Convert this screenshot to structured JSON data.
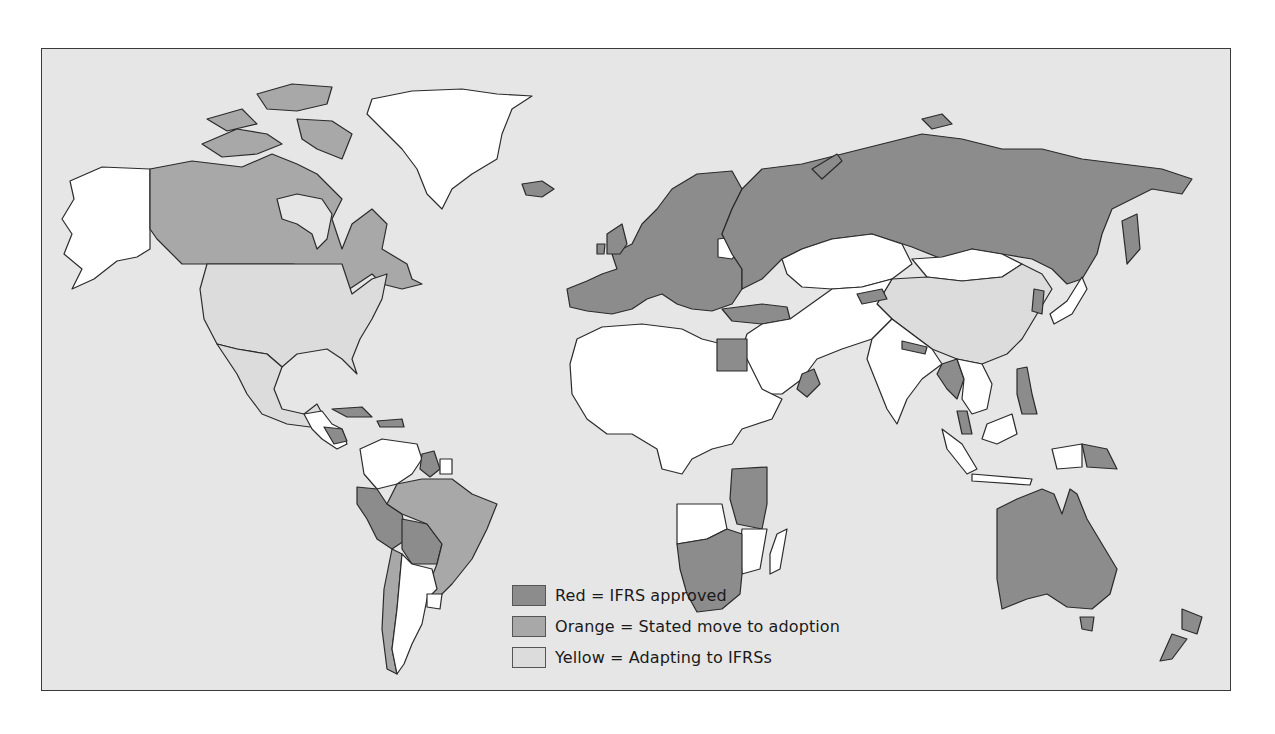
{
  "colors": {
    "ocean": "#e6e6e6",
    "red": "#8c8c8c",
    "orange": "#a8a8a8",
    "yellow": "#dcdcdc",
    "none": "#ffffff",
    "border": "#2b2b2b"
  },
  "legend": {
    "items": [
      {
        "key": "red",
        "label": "Red = IFRS approved"
      },
      {
        "key": "orange",
        "label": "Orange = Stated move to adoption"
      },
      {
        "key": "yellow",
        "label": "Yellow = Adapting to IFRSs"
      }
    ]
  },
  "map": {
    "title": "World map of IFRS adoption status",
    "regions": [
      {
        "name": "Alaska (USA)",
        "status": "none"
      },
      {
        "name": "Canada",
        "status": "orange"
      },
      {
        "name": "Canadian Arctic Islands",
        "status": "orange"
      },
      {
        "name": "Greenland",
        "status": "none"
      },
      {
        "name": "Iceland",
        "status": "red"
      },
      {
        "name": "United States",
        "status": "yellow"
      },
      {
        "name": "Mexico",
        "status": "yellow"
      },
      {
        "name": "Central America",
        "status": "none"
      },
      {
        "name": "Nicaragua",
        "status": "red"
      },
      {
        "name": "Caribbean islands",
        "status": "red"
      },
      {
        "name": "Venezuela / Colombia",
        "status": "none"
      },
      {
        "name": "Guyana",
        "status": "red"
      },
      {
        "name": "Suriname",
        "status": "none"
      },
      {
        "name": "Ecuador",
        "status": "red"
      },
      {
        "name": "Peru",
        "status": "red"
      },
      {
        "name": "Bolivia",
        "status": "red"
      },
      {
        "name": "Brazil",
        "status": "orange"
      },
      {
        "name": "Chile",
        "status": "orange"
      },
      {
        "name": "Argentina",
        "status": "none"
      },
      {
        "name": "Paraguay",
        "status": "none"
      },
      {
        "name": "Uruguay",
        "status": "none"
      },
      {
        "name": "Europe",
        "status": "red"
      },
      {
        "name": "Belarus",
        "status": "none"
      },
      {
        "name": "Russia",
        "status": "red"
      },
      {
        "name": "Turkey",
        "status": "red"
      },
      {
        "name": "Kazakhstan",
        "status": "none"
      },
      {
        "name": "Mongolia",
        "status": "none"
      },
      {
        "name": "China",
        "status": "yellow"
      },
      {
        "name": "Kyrgyzstan",
        "status": "red"
      },
      {
        "name": "Central Asia / Middle East",
        "status": "none"
      },
      {
        "name": "Egypt",
        "status": "red"
      },
      {
        "name": "Oman",
        "status": "red"
      },
      {
        "name": "North & West Africa",
        "status": "none"
      },
      {
        "name": "East Africa (Kenya, Tanzania, Uganda)",
        "status": "red"
      },
      {
        "name": "Southern Africa",
        "status": "red"
      },
      {
        "name": "Angola / Mozambique",
        "status": "none"
      },
      {
        "name": "Madagascar",
        "status": "none"
      },
      {
        "name": "India",
        "status": "none"
      },
      {
        "name": "Nepal",
        "status": "red"
      },
      {
        "name": "Myanmar",
        "status": "red"
      },
      {
        "name": "Thailand / Vietnam",
        "status": "none"
      },
      {
        "name": "Malaysia",
        "status": "red"
      },
      {
        "name": "Philippines",
        "status": "red"
      },
      {
        "name": "Korea",
        "status": "red"
      },
      {
        "name": "Japan",
        "status": "none"
      },
      {
        "name": "Indonesia",
        "status": "none"
      },
      {
        "name": "Papua New Guinea",
        "status": "red"
      },
      {
        "name": "Australia",
        "status": "red"
      },
      {
        "name": "New Zealand",
        "status": "red"
      }
    ]
  }
}
